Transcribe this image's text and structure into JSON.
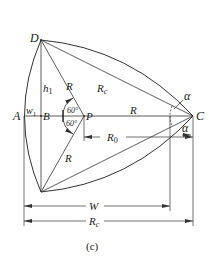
{
  "diagram": {
    "caption": "(c)",
    "points": {
      "A": "A",
      "B": "B",
      "P": "P",
      "C": "C",
      "D": "D"
    },
    "labels": {
      "h1_main": "h",
      "h1_sub": "1",
      "w1_main": "w",
      "w1_sub": "1",
      "R_upper": "R",
      "R_lower": "R",
      "R_horizontal": "R",
      "Rc_main": "R",
      "Rc_sub": "c",
      "R0_main": "R",
      "R0_sub": "0",
      "W": "W",
      "Rc_dim_main": "R",
      "Rc_dim_sub": "c",
      "angle_upper": "60°",
      "angle_lower": "60°",
      "alpha_upper": "α",
      "alpha_lower": "α"
    },
    "colors": {
      "line": "#333333",
      "text": "#222222"
    }
  }
}
